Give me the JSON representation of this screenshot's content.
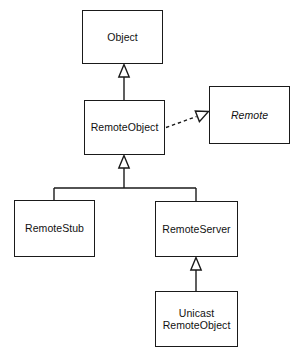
{
  "diagram": {
    "type": "uml-class-diagram",
    "title": "",
    "background_color": "#ffffff",
    "line_color": "#1a1a1a",
    "text_color": "#111111",
    "classes": [
      {
        "id": "object",
        "name": "Object",
        "stereotype": "class",
        "italic": false,
        "x": 82,
        "y": 10,
        "w": 81,
        "h": 54
      },
      {
        "id": "remote-object",
        "name": "RemoteObject",
        "stereotype": "class",
        "italic": false,
        "x": 84,
        "y": 100,
        "w": 81,
        "h": 55
      },
      {
        "id": "remote",
        "name": "Remote",
        "stereotype": "interface",
        "italic": true,
        "x": 209,
        "y": 86,
        "w": 81,
        "h": 58
      },
      {
        "id": "remote-stub",
        "name": "RemoteStub",
        "stereotype": "class",
        "italic": false,
        "x": 14,
        "y": 200,
        "w": 81,
        "h": 57
      },
      {
        "id": "remote-server",
        "name": "RemoteServer",
        "stereotype": "class",
        "italic": false,
        "x": 155,
        "y": 201,
        "w": 83,
        "h": 56
      },
      {
        "id": "unicast-remote-object",
        "name": "Unicast\nRemoteObject",
        "stereotype": "class",
        "italic": false,
        "x": 155,
        "y": 291,
        "w": 83,
        "h": 56
      }
    ],
    "relationships": [
      {
        "id": "rel-remoteobject-extends-object",
        "type": "generalization",
        "from": "remote-object",
        "to": "object",
        "line_style": "solid",
        "arrowhead": "hollow-triangle",
        "label": ""
      },
      {
        "id": "rel-remoteobject-implements-remote",
        "type": "realization",
        "from": "remote-object",
        "to": "remote",
        "line_style": "dashed",
        "arrowhead": "hollow-triangle",
        "label": ""
      },
      {
        "id": "rel-remotestub-extends-remoteobject",
        "type": "generalization",
        "from": "remote-stub",
        "to": "remote-object",
        "line_style": "solid",
        "arrowhead": "hollow-triangle",
        "label": ""
      },
      {
        "id": "rel-remoteserver-extends-remoteobject",
        "type": "generalization",
        "from": "remote-server",
        "to": "remote-object",
        "line_style": "solid",
        "arrowhead": "hollow-triangle",
        "label": ""
      },
      {
        "id": "rel-unicast-extends-remoteserver",
        "type": "generalization",
        "from": "unicast-remote-object",
        "to": "remote-server",
        "line_style": "solid",
        "arrowhead": "hollow-triangle",
        "label": ""
      }
    ]
  }
}
